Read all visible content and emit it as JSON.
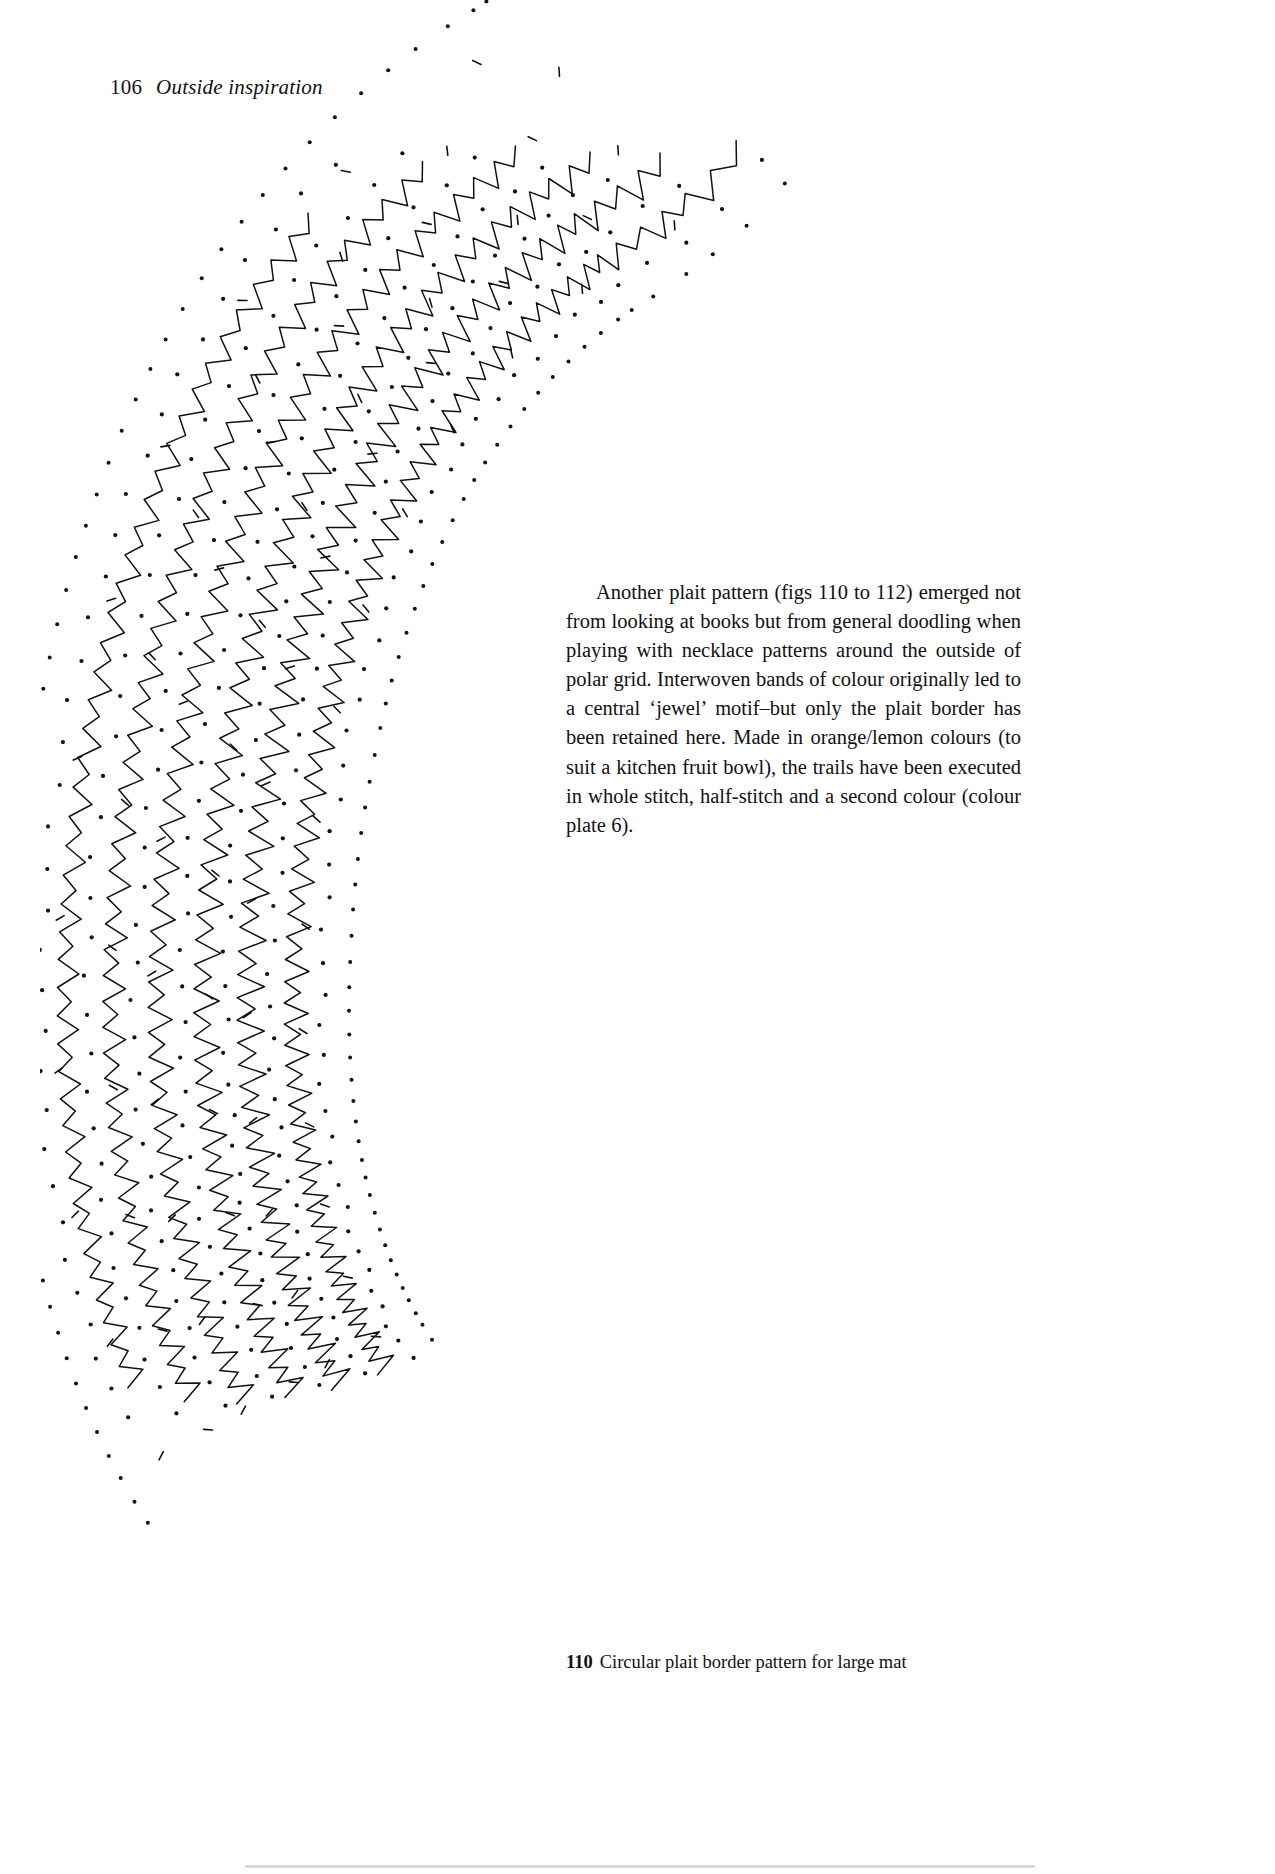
{
  "page": {
    "width": 1275,
    "height": 1874,
    "background_color": "#ffffff",
    "ink_color": "#111111"
  },
  "running_head": {
    "folio": "106",
    "title": "Outside inspiration"
  },
  "body": {
    "paragraph": "Another plait pattern (figs 110 to 112) emerged not from looking at books but from general doodling when playing with necklace patterns around the outside of polar grid. Interwoven bands of colour originally led to a central ‘jewel’ motif–but only the plait border has been retained here. Made in orange/lemon colours (to suit a kitchen fruit bowl), the trails have been executed in whole stitch, half-stitch and a second colour (colour plate 6)."
  },
  "figure": {
    "number": "110",
    "caption": "Circular plait border pattern for large mat",
    "alt": "bobbin-lace pricking: curved band of zigzag trails with pin-dot grid and dashed guide lines"
  },
  "chart_data": {
    "type": "line",
    "title": "Circular plait border pattern for large mat",
    "xlabel": "",
    "ylabel": "",
    "bands": [
      {
        "name": "trail-1",
        "zigzags": 34,
        "amplitude": 16,
        "stroke": "#111111"
      },
      {
        "name": "trail-2",
        "zigzags": 32,
        "amplitude": 18,
        "stroke": "#111111"
      },
      {
        "name": "trail-3",
        "zigzags": 30,
        "amplitude": 17,
        "stroke": "#111111"
      },
      {
        "name": "trail-4",
        "zigzags": 28,
        "amplitude": 16,
        "stroke": "#111111"
      },
      {
        "name": "trail-5",
        "zigzags": 26,
        "amplitude": 15,
        "stroke": "#111111"
      },
      {
        "name": "trail-6",
        "zigzags": 22,
        "amplitude": 14,
        "stroke": "#111111"
      }
    ],
    "grid": false,
    "legend": "none"
  }
}
